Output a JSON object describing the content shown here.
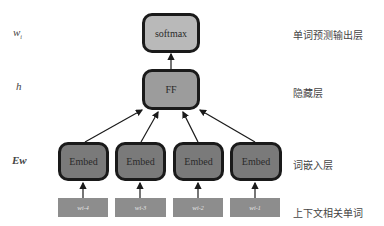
{
  "left_labels": {
    "output": "w",
    "output_sub": "i",
    "hidden": "h",
    "embedding": "Ew"
  },
  "nodes": {
    "softmax": "softmax",
    "ff": "FF",
    "embeds": [
      "Embed",
      "Embed",
      "Embed",
      "Embed"
    ]
  },
  "inputs": [
    {
      "base": "w",
      "sub": "i-4"
    },
    {
      "base": "w",
      "sub": "i-3"
    },
    {
      "base": "w",
      "sub": "i-2"
    },
    {
      "base": "w",
      "sub": "i-1"
    }
  ],
  "right_labels": {
    "output": "单词预测输出层",
    "hidden": "隐藏层",
    "embedding": "词嵌入层",
    "context": "上下文相关单词"
  },
  "colors": {
    "softmax_fill": "#b9b9b9",
    "ff_fill": "#9c9c9c",
    "embed_fill": "#7a7a7a",
    "input_fill": "#8d8d8d",
    "border": "#1a1a1a"
  }
}
